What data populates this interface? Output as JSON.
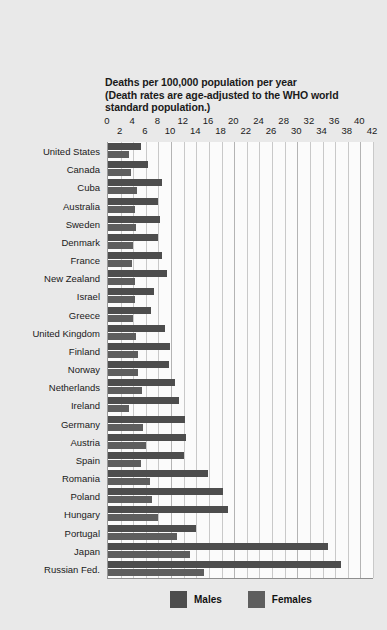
{
  "chart_data": {
    "type": "bar",
    "orientation": "horizontal",
    "title": "Deaths per 100,000 population per year",
    "subtitle": "(Death rates are age-adjusted to the WHO world standard population.)",
    "title_lines": [
      "Deaths per 100,000 population per year",
      "(Death rates are age-adjusted to the WHO world",
      "standard population.)"
    ],
    "xlabel": "",
    "ylabel": "",
    "xlim": [
      0,
      42
    ],
    "xticks": [
      0,
      2,
      4,
      6,
      8,
      10,
      12,
      14,
      16,
      18,
      20,
      22,
      24,
      26,
      28,
      30,
      32,
      34,
      36,
      38,
      40,
      42
    ],
    "grid": true,
    "grid_axis": "x",
    "legend_position": "bottom",
    "categories": [
      "United States",
      "Canada",
      "Cuba",
      "Australia",
      "Sweden",
      "Denmark",
      "France",
      "New Zealand",
      "Israel",
      "Greece",
      "United Kingdom",
      "Finland",
      "Norway",
      "Netherlands",
      "Ireland",
      "Germany",
      "Austria",
      "Spain",
      "Romania",
      "Poland",
      "Hungary",
      "Portugal",
      "Japan",
      "Russian Fed."
    ],
    "series": [
      {
        "name": "Males",
        "color": "#4d4d4d",
        "values": [
          5.2,
          6.3,
          8.5,
          8.0,
          8.2,
          8.0,
          8.5,
          9.4,
          7.3,
          6.8,
          9.0,
          9.8,
          9.6,
          10.6,
          11.2,
          12.2,
          12.4,
          12.0,
          15.8,
          18.2,
          19.0,
          14.0,
          34.8,
          37.0
        ],
        "label": "Males"
      },
      {
        "name": "Females",
        "color": "#5e5e5e",
        "values": [
          3.3,
          3.6,
          4.6,
          4.2,
          4.4,
          4.0,
          3.8,
          4.2,
          4.2,
          4.0,
          4.4,
          4.8,
          4.8,
          5.4,
          3.4,
          5.6,
          6.0,
          5.2,
          6.6,
          7.0,
          8.0,
          11.0,
          13.0,
          15.2
        ]
      }
    ],
    "legend": [
      {
        "label": "Males",
        "color": "#4d4d4d"
      },
      {
        "label": "Females",
        "color": "#5e5e5e"
      }
    ]
  },
  "colors": {
    "background": "#e9e9e9",
    "plot_background": "#fbfbfb",
    "gridline": "#c9c9c9",
    "axis": "#8e8e8e",
    "text": "#1a1a1a",
    "males": "#4d4d4d",
    "females": "#5e5e5e"
  }
}
